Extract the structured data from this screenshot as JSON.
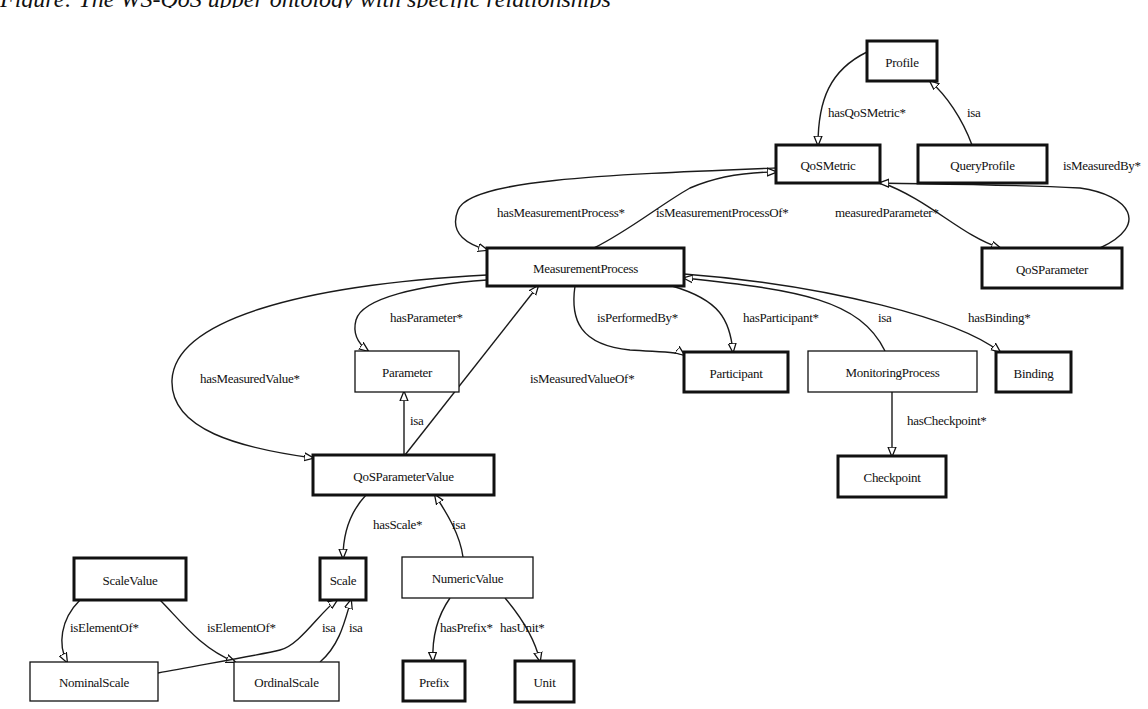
{
  "caption": "Figure: The WS-QoS upper ontology with specific relationships",
  "diagram": {
    "nodes": [
      {
        "id": "profile",
        "label": "Profile",
        "x": 867,
        "y": 41,
        "w": 70,
        "h": 40,
        "bold": true
      },
      {
        "id": "qosmetric",
        "label": "QoSMetric",
        "x": 776,
        "y": 145,
        "w": 104,
        "h": 38,
        "bold": true
      },
      {
        "id": "queryprofile",
        "label": "QueryProfile",
        "x": 918,
        "y": 145,
        "w": 129,
        "h": 38,
        "bold": true
      },
      {
        "id": "measurementprocess",
        "label": "MeasurementProcess",
        "x": 487,
        "y": 248,
        "w": 197,
        "h": 38,
        "bold": true
      },
      {
        "id": "qosparameter",
        "label": "QoSParameter",
        "x": 982,
        "y": 248,
        "w": 140,
        "h": 40,
        "bold": true
      },
      {
        "id": "parameter",
        "label": "Parameter",
        "x": 355,
        "y": 351,
        "w": 104,
        "h": 41,
        "bold": false
      },
      {
        "id": "participant",
        "label": "Participant",
        "x": 684,
        "y": 352,
        "w": 104,
        "h": 40,
        "bold": true
      },
      {
        "id": "monitoringprocess",
        "label": "MonitoringProcess",
        "x": 808,
        "y": 351,
        "w": 169,
        "h": 41,
        "bold": false
      },
      {
        "id": "binding",
        "label": "Binding",
        "x": 996,
        "y": 352,
        "w": 75,
        "h": 40,
        "bold": true
      },
      {
        "id": "qosparametervalue",
        "label": "QoSParameterValue",
        "x": 313,
        "y": 455,
        "w": 181,
        "h": 40,
        "bold": true
      },
      {
        "id": "checkpoint",
        "label": "Checkpoint",
        "x": 838,
        "y": 456,
        "w": 108,
        "h": 41,
        "bold": true
      },
      {
        "id": "scalevalue",
        "label": "ScaleValue",
        "x": 74,
        "y": 558,
        "w": 112,
        "h": 42,
        "bold": true
      },
      {
        "id": "scale",
        "label": "Scale",
        "x": 320,
        "y": 558,
        "w": 46,
        "h": 42,
        "bold": true
      },
      {
        "id": "numericvalue",
        "label": "NumericValue",
        "x": 402,
        "y": 557,
        "w": 131,
        "h": 41,
        "bold": false
      },
      {
        "id": "nominalscale",
        "label": "NominalScale",
        "x": 30,
        "y": 662,
        "w": 128,
        "h": 39,
        "bold": false
      },
      {
        "id": "ordinalscale",
        "label": "OrdinalScale",
        "x": 234,
        "y": 662,
        "w": 105,
        "h": 39,
        "bold": false
      },
      {
        "id": "prefix",
        "label": "Prefix",
        "x": 403,
        "y": 661,
        "w": 62,
        "h": 40,
        "bold": true
      },
      {
        "id": "unit",
        "label": "Unit",
        "x": 515,
        "y": 661,
        "w": 59,
        "h": 41,
        "bold": true
      }
    ],
    "edges": [
      {
        "from": "profile",
        "to": "qosmetric",
        "label": "hasQoSMetric*",
        "lx": 828,
        "ly": 117,
        "d": "M 867 52 C 830 70, 818 100, 818 145"
      },
      {
        "from": "queryprofile",
        "to": "profile",
        "label": "isa",
        "lx": 967,
        "ly": 117,
        "d": "M 972 145 C 962 118, 946 95, 930 81"
      },
      {
        "from": "qosmetric",
        "to": "queryprofile",
        "label": "isMeasuredBy*",
        "lx": 1063,
        "ly": 170,
        "d": ""
      },
      {
        "from": "qosmetric",
        "to": "measurementprocess",
        "label": "hasMeasurementProcess*",
        "lx": 497,
        "ly": 217,
        "d": "M 776 168 C 600 175, 470 180, 458 210 C 448 235, 470 245, 487 250"
      },
      {
        "from": "measurementprocess",
        "to": "qosmetric",
        "label": "isMeasurementProcessOf*",
        "lx": 656,
        "ly": 217,
        "d": "M 594 248 C 630 230, 660 205, 690 188 C 720 175, 750 172, 776 172"
      },
      {
        "from": "qosmetric",
        "to": "qosparameter",
        "label": "measuredParameter*",
        "lx": 835,
        "ly": 217,
        "d": "M 880 182 C 930 200, 960 235, 1000 248"
      },
      {
        "from": "qosparameter",
        "to": "qosmetric",
        "label": "",
        "lx": 0,
        "ly": 0,
        "d": "M 1100 248 C 1150 225, 1130 195, 1080 188 C 1000 184, 920 184, 880 183"
      },
      {
        "from": "measurementprocess",
        "to": "parameter",
        "label": "hasParameter*",
        "lx": 390,
        "ly": 322,
        "d": "M 487 280 C 420 285, 362 298, 356 320 C 352 335, 360 345, 368 351"
      },
      {
        "from": "measurementprocess",
        "to": "qosparametervalue",
        "label": "hasMeasuredValue*",
        "lx": 200,
        "ly": 383,
        "d": "M 487 275 C 300 285, 175 320, 172 380 C 170 430, 240 448, 313 458"
      },
      {
        "from": "qosparametervalue",
        "to": "measurementprocess",
        "label": "isMeasuredValueOf*",
        "lx": 530,
        "ly": 383,
        "d": "M 405 455 L 538 286"
      },
      {
        "from": "qosparametervalue",
        "to": "parameter",
        "label": "isa",
        "lx": 410,
        "ly": 425,
        "d": "M 404 455 L 404 392"
      },
      {
        "from": "measurementprocess",
        "to": "participant",
        "label": "isPerformedBy*",
        "lx": 597,
        "ly": 322,
        "d": "M 575 286 C 570 320, 580 345, 630 350 C 660 352, 680 352, 684 355"
      },
      {
        "from": "measurementprocess",
        "to": "participant",
        "label": "hasParticipant*",
        "lx": 743,
        "ly": 322,
        "d": "M 672 286 C 720 300, 730 320, 733 352"
      },
      {
        "from": "monitoringprocess",
        "to": "measurementprocess",
        "label": "isa",
        "lx": 878,
        "ly": 322,
        "d": "M 885 351 C 860 300, 800 290, 684 278"
      },
      {
        "from": "measurementprocess",
        "to": "binding",
        "label": "hasBinding*",
        "lx": 968,
        "ly": 322,
        "d": "M 684 274 C 830 285, 960 320, 1000 352"
      },
      {
        "from": "monitoringprocess",
        "to": "checkpoint",
        "label": "hasCheckpoint*",
        "lx": 907,
        "ly": 425,
        "d": "M 892 392 L 892 456"
      },
      {
        "from": "qosparametervalue",
        "to": "scale",
        "label": "hasScale*",
        "lx": 373,
        "ly": 529,
        "d": "M 366 495 C 350 512, 343 535, 343 558"
      },
      {
        "from": "numericvalue",
        "to": "qosparametervalue",
        "label": "isa",
        "lx": 452,
        "ly": 529,
        "d": "M 463 557 C 460 535, 448 515, 435 495"
      },
      {
        "from": "scalevalue",
        "to": "nominalscale",
        "label": "isElementOf*",
        "lx": 70,
        "ly": 632,
        "d": "M 80 600 C 60 620, 58 645, 67 662"
      },
      {
        "from": "scalevalue",
        "to": "ordinalscale",
        "label": "isElementOf*",
        "lx": 207,
        "ly": 632,
        "d": "M 160 600 C 180 620, 200 648, 235 662"
      },
      {
        "from": "nominalscale",
        "to": "scale",
        "label": "isa",
        "lx": 322,
        "ly": 632,
        "d": "M 158 673 C 200 665, 260 655, 280 650 C 300 645, 320 612, 337 600"
      },
      {
        "from": "ordinalscale",
        "to": "scale",
        "label": "isa",
        "lx": 349,
        "ly": 632,
        "d": "M 320 662 C 340 645, 345 620, 351 600"
      },
      {
        "from": "numericvalue",
        "to": "prefix",
        "label": "hasPrefix*",
        "lx": 440,
        "ly": 632,
        "d": "M 450 598 C 436 618, 432 640, 433 661"
      },
      {
        "from": "numericvalue",
        "to": "unit",
        "label": "hasUnit*",
        "lx": 500,
        "ly": 632,
        "d": "M 505 598 C 522 618, 535 640, 540 661"
      }
    ]
  }
}
